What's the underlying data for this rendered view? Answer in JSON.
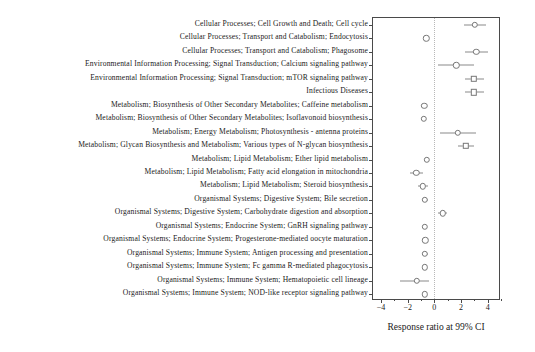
{
  "chart_data": {
    "type": "scatter",
    "title": "",
    "xlabel": "Response ratio at 99% CI",
    "ylabel": "",
    "xlim": [
      -4.6,
      5.0
    ],
    "xticks": [
      -4,
      -2,
      0,
      2,
      4
    ],
    "xticklabels": [
      "−4",
      "−2",
      "0",
      "2",
      "4"
    ],
    "reference_line": 0,
    "grid": false,
    "legend": null,
    "categories": [
      "Cellular Processes; Cell Growth and Death; Cell cycle",
      "Cellular Processes; Transport and Catabolism; Endocytosis",
      "Cellular Processes; Transport and Catabolism; Phagosome",
      "Environmental Information Processing; Signal Transduction; Calcium signaling pathway",
      "Environmental Information Processing; Signal Transduction; mTOR signaling pathway",
      "Infectious Diseases",
      "Metabolism; Biosynthesis of Other Secondary Metabolites; Caffeine metabolism",
      "Metabolism; Biosynthesis of Other Secondary Metabolites; Isoflavonoid biosynthesis",
      "Metabolism; Energy Metabolism; Photosynthesis - antenna proteins",
      "Metabolism; Glycan Biosynthesis and Metabolism; Various types of N-glycan biosynthesis",
      "Metabolism; Lipid Metabolism; Ether lipid metabolism",
      "Metabolism; Lipid Metabolism; Fatty acid elongation in mitochondria",
      "Metabolism; Lipid Metabolism; Steroid biosynthesis",
      "Organismal Systems; Digestive System; Bile secretion",
      "Organismal Systems; Digestive System; Carbohydrate digestion and absorption",
      "Organismal Systems; Endocrine System; GnRH signaling pathway",
      "Organismal Systems; Endocrine System; Progesterone-mediated oocyte maturation",
      "Organismal Systems; Immune System; Antigen processing and presentation",
      "Organismal Systems; Immune System; Fc gamma R-mediated phagocytosis",
      "Organismal Systems; Immune System; Hematopoietic cell lineage",
      "Organismal Systems; Immune System; NOD-like receptor signaling pathway"
    ],
    "points": [
      {
        "label": "Cellular Processes; Cell Growth and Death; Cell cycle",
        "value": 3.05,
        "low": 2.25,
        "high": 3.9,
        "marker": "circle"
      },
      {
        "label": "Cellular Processes; Transport and Catabolism; Endocytosis",
        "value": -0.6,
        "low": -0.72,
        "high": -0.48,
        "marker": "circle"
      },
      {
        "label": "Cellular Processes; Transport and Catabolism; Phagosome",
        "value": 3.15,
        "low": 2.3,
        "high": 4.0,
        "marker": "circle"
      },
      {
        "label": "Environmental Information Processing; Signal Transduction; Calcium signaling pathway",
        "value": 1.65,
        "low": 0.3,
        "high": 3.0,
        "marker": "circle"
      },
      {
        "label": "Environmental Information Processing; Signal Transduction; mTOR signaling pathway",
        "value": 2.95,
        "low": 2.3,
        "high": 3.7,
        "marker": "square"
      },
      {
        "label": "Infectious Diseases",
        "value": 2.95,
        "low": 2.3,
        "high": 3.7,
        "marker": "square"
      },
      {
        "label": "Metabolism; Biosynthesis of Other Secondary Metabolites; Caffeine metabolism",
        "value": -0.75,
        "low": -0.95,
        "high": -0.55,
        "marker": "circle"
      },
      {
        "label": "Metabolism; Biosynthesis of Other Secondary Metabolites; Isoflavonoid biosynthesis",
        "value": -0.8,
        "low": -0.95,
        "high": -0.65,
        "marker": "circle"
      },
      {
        "label": "Metabolism; Energy Metabolism; Photosynthesis - antenna proteins",
        "value": 1.75,
        "low": 0.45,
        "high": 3.15,
        "marker": "circle"
      },
      {
        "label": "Metabolism; Glycan Biosynthesis and Metabolism; Various types of N-glycan biosynthesis",
        "value": 2.35,
        "low": 1.8,
        "high": 2.95,
        "marker": "square"
      },
      {
        "label": "Metabolism; Lipid Metabolism; Ether lipid metabolism",
        "value": -0.55,
        "low": -0.68,
        "high": -0.42,
        "marker": "circle"
      },
      {
        "label": "Metabolism; Lipid Metabolism; Fatty acid elongation in mitochondria",
        "value": -1.35,
        "low": -1.85,
        "high": -0.85,
        "marker": "circle"
      },
      {
        "label": "Metabolism; Lipid Metabolism; Steroid biosynthesis",
        "value": -0.85,
        "low": -1.25,
        "high": -0.45,
        "marker": "circle"
      },
      {
        "label": "Organismal Systems; Digestive System; Bile secretion",
        "value": -0.7,
        "low": -0.9,
        "high": -0.5,
        "marker": "circle"
      },
      {
        "label": "Organismal Systems; Digestive System; Carbohydrate digestion and absorption",
        "value": 0.62,
        "low": 0.28,
        "high": 0.96,
        "marker": "circle"
      },
      {
        "label": "Organismal Systems; Endocrine System; GnRH signaling pathway",
        "value": -0.72,
        "low": -0.84,
        "high": -0.6,
        "marker": "circle"
      },
      {
        "label": "Organismal Systems; Endocrine System; Progesterone-mediated oocyte maturation",
        "value": -0.68,
        "low": -0.92,
        "high": -0.44,
        "marker": "circle"
      },
      {
        "label": "Organismal Systems; Immune System; Antigen processing and presentation",
        "value": -0.7,
        "low": -0.95,
        "high": -0.45,
        "marker": "circle"
      },
      {
        "label": "Organismal Systems; Immune System; Fc gamma R-mediated phagocytosis",
        "value": -0.72,
        "low": -0.84,
        "high": -0.6,
        "marker": "circle"
      },
      {
        "label": "Organismal Systems; Immune System; Hematopoietic cell lineage",
        "value": -1.3,
        "low": -2.55,
        "high": -0.42,
        "marker": "circle"
      },
      {
        "label": "Organismal Systems; Immune System; NOD-like receptor signaling pathway",
        "value": -0.72,
        "low": -0.92,
        "high": -0.52,
        "marker": "circle"
      }
    ]
  },
  "axis": {
    "x_title": "Response ratio at 99% CI"
  }
}
